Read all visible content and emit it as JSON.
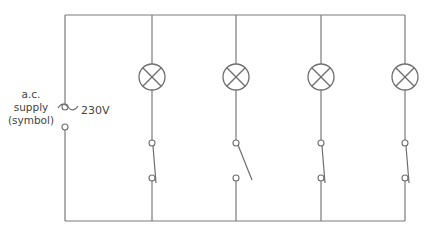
{
  "diagram": {
    "colors": {
      "wire": "#7a7a7a",
      "component": "#6e6e6e",
      "text": "#444444",
      "background": "#ffffff"
    },
    "supply": {
      "label_lines": [
        "a.c.",
        "supply",
        "(symbol)"
      ],
      "symbol": "ac-tilde",
      "voltage": "230V",
      "x": 65,
      "terminal_top_y": 107,
      "terminal_bottom_y": 127
    },
    "frame": {
      "left": 65,
      "right": 405,
      "top": 15,
      "bottom": 221
    },
    "branches": [
      {
        "id": 1,
        "x": 152,
        "lamp_y": 77,
        "switch": "closed"
      },
      {
        "id": 2,
        "x": 236,
        "lamp_y": 77,
        "switch": "open"
      },
      {
        "id": 3,
        "x": 321,
        "lamp_y": 77,
        "switch": "closed"
      },
      {
        "id": 4,
        "x": 405,
        "lamp_y": 77,
        "switch": "closed"
      }
    ],
    "switch_geometry": {
      "top_y": 143,
      "bottom_y": 178,
      "terminal_r": 3,
      "lamp_r": 13
    }
  }
}
